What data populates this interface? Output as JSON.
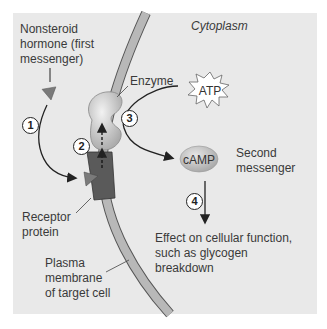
{
  "labels": {
    "hormone_line1": "Nonsteroid",
    "hormone_line2": "hormone (first",
    "hormone_line3": "messenger)",
    "cytoplasm": "Cytoplasm",
    "enzyme": "Enzyme",
    "atp": "ATP",
    "camp": "cAMP",
    "second_line1": "Second",
    "second_line2": "messenger",
    "receptor_line1": "Receptor",
    "receptor_line2": "protein",
    "effect_line1": "Effect on cellular function,",
    "effect_line2": "such as glycogen",
    "effect_line3": "breakdown",
    "membrane_line1": "Plasma",
    "membrane_line2": "membrane",
    "membrane_line3": "of target cell"
  },
  "steps": [
    "1",
    "2",
    "3",
    "4"
  ],
  "colors": {
    "background": "#e9e9e9",
    "membrane": "#b8b8b8",
    "receptor": "#5a5a5a",
    "hormone": "#7a7a7a",
    "enzyme": "#c4c4c4",
    "camp": "#bdbdbd"
  }
}
